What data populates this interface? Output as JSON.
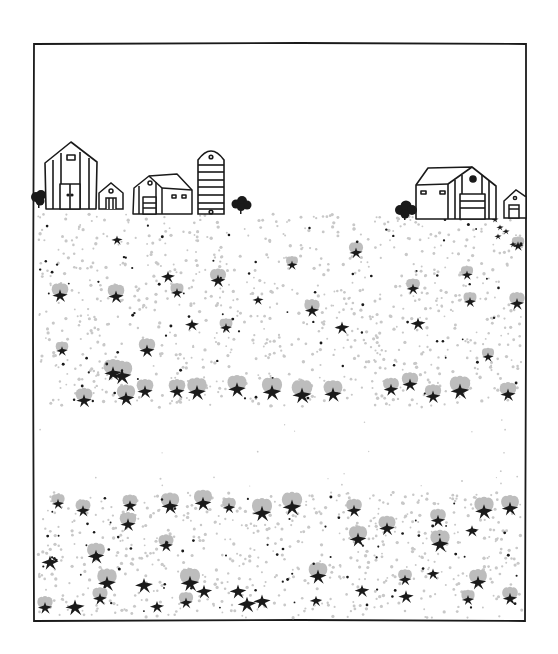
{
  "illustration": {
    "title": "Farm landscape with barns and flowering field",
    "style": "hand-drawn black ink line art with gray stippling",
    "colors": {
      "ink": "#1a1a1a",
      "stipple": "#c8c8c8",
      "petal": "#bdbdbd",
      "background": "#ffffff"
    },
    "frame": {
      "x": 33,
      "y": 43,
      "width": 493,
      "height": 578
    },
    "horizon_y": 212,
    "upper_field": {
      "y_start": 212,
      "y_end": 410
    },
    "blank_band": {
      "y_start": 410,
      "y_end": 490
    },
    "lower_field": {
      "y_start": 490,
      "y_end": 620
    },
    "buildings": [
      {
        "name": "tall-barn-left",
        "x": 45,
        "y": 142,
        "width": 52,
        "height": 68
      },
      {
        "name": "small-shed-left",
        "x": 98,
        "y": 183,
        "width": 26,
        "height": 27
      },
      {
        "name": "barn-with-annex",
        "x": 132,
        "y": 174,
        "width": 62,
        "height": 40
      },
      {
        "name": "silo",
        "x": 197,
        "y": 149,
        "width": 28,
        "height": 65
      },
      {
        "name": "large-barn-right",
        "x": 414,
        "y": 167,
        "width": 82,
        "height": 52
      },
      {
        "name": "small-shed-right",
        "x": 503,
        "y": 190,
        "width": 23,
        "height": 28
      }
    ],
    "trees": [
      {
        "name": "bush-far-left",
        "x": 38,
        "y": 198
      },
      {
        "name": "bush-near-silo",
        "x": 240,
        "y": 204
      },
      {
        "name": "bush-near-right-barn",
        "x": 405,
        "y": 210
      }
    ]
  }
}
